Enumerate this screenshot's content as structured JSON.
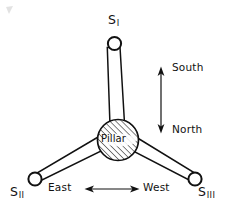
{
  "figure": {
    "background_color": "#ffffff",
    "line_color": "#111111"
  },
  "labels": {
    "sensor_1": {
      "base": "S",
      "subscript": "I"
    },
    "sensor_2": {
      "base": "S",
      "subscript": "II"
    },
    "sensor_3": {
      "base": "S",
      "subscript": "III"
    },
    "pillar": "Pillar",
    "south": "South",
    "north": "North",
    "east": "East",
    "west": "West"
  },
  "diagram_data": {
    "type": "schematic",
    "center": {
      "name": "pillar",
      "x": 118,
      "y": 140,
      "radius": 21,
      "fill": "hatched"
    },
    "arms": [
      {
        "name": "arm-s1",
        "from": [
          118,
          140
        ],
        "to": [
          114,
          44
        ],
        "end_node": "sensor_1",
        "node_radius": 7
      },
      {
        "name": "arm-s2",
        "from": [
          118,
          140
        ],
        "to": [
          35,
          179
        ],
        "end_node": "sensor_2",
        "node_radius": 7
      },
      {
        "name": "arm-s3",
        "from": [
          118,
          140
        ],
        "to": [
          195,
          179
        ],
        "end_node": "sensor_3",
        "node_radius": 7
      }
    ],
    "compass": {
      "vertical": {
        "name": "south-north-arrow",
        "x": 161,
        "y1": 68,
        "y2": 131,
        "top_label": "South",
        "bottom_label": "North",
        "double_headed": true
      },
      "horizontal": {
        "name": "east-west-arrow",
        "y": 189,
        "x1": 85,
        "x2": 139,
        "left_label": "East",
        "right_label": "West",
        "double_headed": true
      }
    }
  }
}
